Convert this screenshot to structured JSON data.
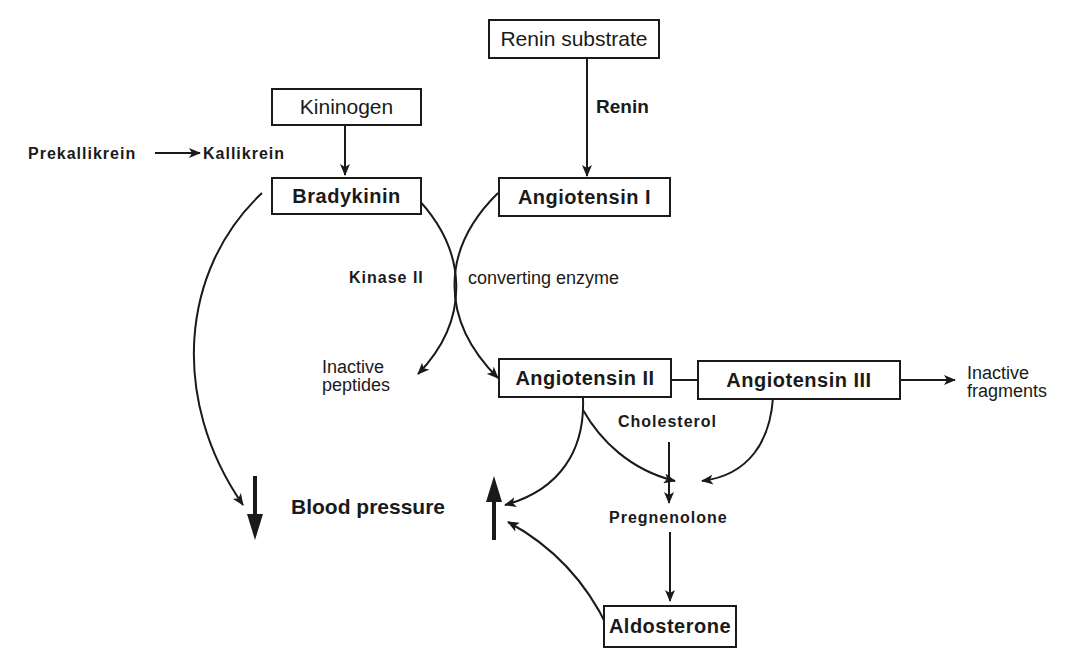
{
  "nodes": {
    "renin_substrate": "Renin substrate",
    "kininogen": "Kininogen",
    "bradykinin": "Bradykinin",
    "angiotensin_1": "Angiotensin I",
    "angiotensin_2": "Angiotensin II",
    "angiotensin_3": "Angiotensin III",
    "aldosterone": "Aldosterone"
  },
  "labels": {
    "renin": "Renin",
    "prekallikrein": "Prekallikrein",
    "kallikrein": "Kallikrein",
    "kinase_2": "Kinase II",
    "converting_enzyme": "converting enzyme",
    "inactive_peptides_1": "Inactive",
    "inactive_peptides_2": "peptides",
    "inactive_fragments_1": "Inactive",
    "inactive_fragments_2": "fragments",
    "cholesterol": "Cholesterol",
    "pregnenolone": "Pregnenolone",
    "blood_pressure": "Blood pressure"
  },
  "edges": [
    {
      "from": "Renin substrate",
      "to": "Angiotensin I",
      "label": "Renin"
    },
    {
      "from": "Prekallikrein",
      "to": "Kallikrein"
    },
    {
      "from": "Kininogen",
      "to": "Bradykinin"
    },
    {
      "from": "Bradykinin",
      "to": "Inactive peptides",
      "label": "Kinase II"
    },
    {
      "from": "Angiotensin I",
      "to": "Angiotensin II",
      "label": "converting enzyme"
    },
    {
      "from": "Angiotensin II",
      "to": "Angiotensin III"
    },
    {
      "from": "Angiotensin III",
      "to": "Inactive fragments"
    },
    {
      "from": "Bradykinin",
      "to": "Blood pressure decrease"
    },
    {
      "from": "Angiotensin II",
      "to": "Blood pressure increase"
    },
    {
      "from": "Angiotensin II",
      "to": "Pregnenolone"
    },
    {
      "from": "Angiotensin III",
      "to": "Pregnenolone"
    },
    {
      "from": "Cholesterol",
      "to": "Pregnenolone"
    },
    {
      "from": "Pregnenolone",
      "to": "Aldosterone"
    },
    {
      "from": "Aldosterone",
      "to": "Blood pressure increase"
    }
  ]
}
